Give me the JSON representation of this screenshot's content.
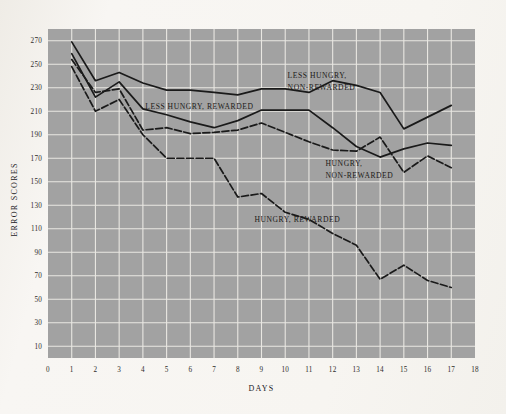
{
  "chart_data": {
    "type": "line",
    "title": "",
    "xlabel": "DAYS",
    "ylabel": "ERROR SCORES",
    "xlim": [
      0,
      18
    ],
    "ylim": [
      0,
      280
    ],
    "grid": true,
    "legend_position": "inline-annotations",
    "x_ticks": [
      "0",
      "1",
      "2",
      "3",
      "4",
      "5",
      "6",
      "7",
      "8",
      "9",
      "10",
      "11",
      "12",
      "13",
      "14",
      "15",
      "16",
      "17",
      "18"
    ],
    "y_ticks": [
      "10",
      "30",
      "50",
      "70",
      "90",
      "110",
      "130",
      "150",
      "170",
      "190",
      "210",
      "230",
      "250",
      "270"
    ],
    "x": [
      1,
      2,
      3,
      4,
      5,
      6,
      7,
      8,
      9,
      10,
      11,
      12,
      13,
      14,
      15,
      16,
      17
    ],
    "series": [
      {
        "name": "LESS HUNGRY, NON-REWARDED",
        "style": "solid",
        "color": "#1a1a1a",
        "label_x": 10.1,
        "label_y": 238,
        "values": [
          269,
          236,
          243,
          234,
          228,
          228,
          226,
          224,
          229,
          229,
          226,
          236,
          232,
          226,
          195,
          205,
          215
        ]
      },
      {
        "name": "LESS HUNGRY, REWARDED",
        "style": "solid",
        "color": "#1a1a1a",
        "label_x": 4.1,
        "label_y": 212,
        "values": [
          259,
          222,
          235,
          212,
          207,
          201,
          196,
          202,
          211,
          211,
          211,
          196,
          180,
          171,
          178,
          183,
          181
        ]
      },
      {
        "name": "HUNGRY, NON-REWARDED",
        "style": "dashed",
        "color": "#1a1a1a",
        "label_x": 11.7,
        "label_y": 163,
        "values": [
          254,
          226,
          229,
          194,
          196,
          191,
          192,
          194,
          200,
          192,
          184,
          177,
          176,
          188,
          158,
          172,
          162
        ]
      },
      {
        "name": "HUNGRY, REWARDED",
        "style": "dashed",
        "color": "#1a1a1a",
        "label_x": 8.7,
        "label_y": 116,
        "values": [
          248,
          210,
          220,
          190,
          170,
          170,
          170,
          137,
          140,
          124,
          118,
          106,
          96,
          67,
          79,
          66,
          60
        ]
      }
    ]
  }
}
